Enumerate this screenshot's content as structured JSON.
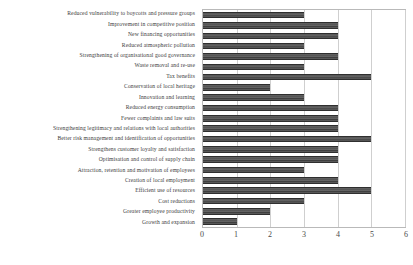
{
  "chart_data": {
    "type": "bar",
    "orientation": "horizontal",
    "title": "",
    "xlabel": "",
    "ylabel": "",
    "xlim": [
      0,
      6
    ],
    "xticks": [
      0,
      1,
      2,
      3,
      4,
      5,
      6
    ],
    "grid": true,
    "legend": null,
    "bar_color": "#555555",
    "categories": [
      "Reduced vulnerability to boycotts and pressure groups",
      "Improvement in competitive position",
      "New financing opportunities",
      "Reduced atmospheric pollution",
      "Strengthening of organisational good governance",
      "Waste removal and re-use",
      "Tax benefits",
      "Conservation of local heritage",
      "Innovation and learning",
      "Reduced energy consumption",
      "Fewer complaints and law suits",
      "Strengthening legitimacy and relations with local authorities",
      "Better risk management and identification of opportunities",
      "Strengthens customer loyalty and satisfaction",
      "Optimisation and control of supply chain",
      "Attraction, retention and motivation of employees",
      "Creation of local employment",
      "Efficient use of resources",
      "Cost reductions",
      "Greater employee productivity",
      "Growth and expansion"
    ],
    "values": [
      3,
      4,
      4,
      3,
      4,
      3,
      5,
      2,
      3,
      4,
      4,
      4,
      5,
      4,
      4,
      3,
      4,
      5,
      3,
      2,
      1
    ]
  }
}
